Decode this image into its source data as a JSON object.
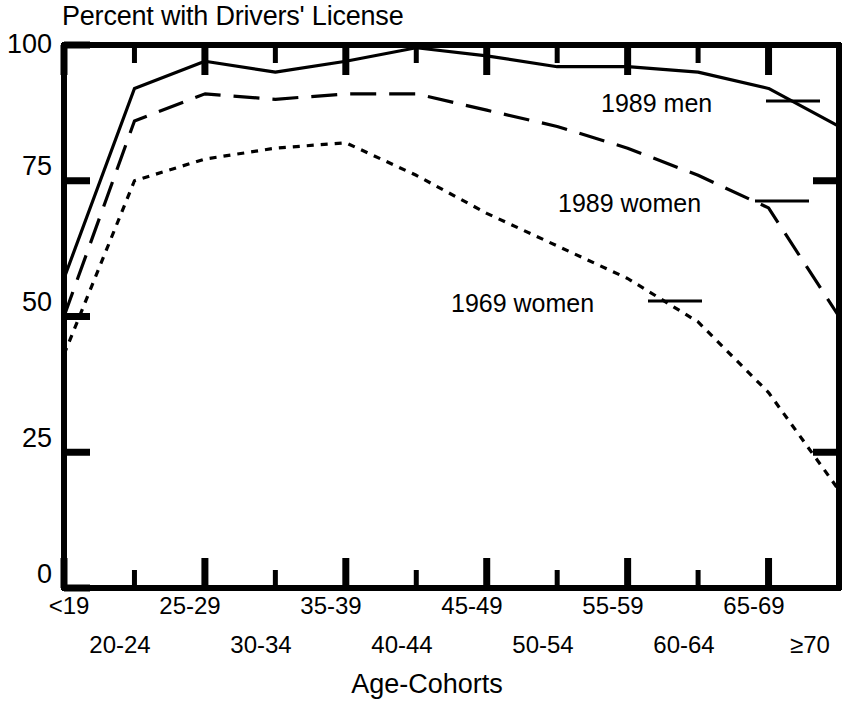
{
  "chart_data": {
    "type": "line",
    "title": "Percent with Drivers' License",
    "xlabel": "Age-Cohorts",
    "ylabel": "",
    "categories": [
      "<19",
      "20-24",
      "25-29",
      "30-34",
      "35-39",
      "40-44",
      "45-49",
      "50-54",
      "55-59",
      "60-64",
      "65-69",
      "≥70"
    ],
    "series": [
      {
        "name": "1989 men",
        "style": "solid",
        "values": [
          57,
          92,
          97,
          95,
          97,
          99.5,
          98,
          96,
          96,
          95,
          92,
          85
        ]
      },
      {
        "name": "1989 women",
        "style": "long-dash",
        "values": [
          50,
          86,
          91,
          90,
          91,
          91,
          88,
          85,
          81,
          76,
          70,
          50
        ]
      },
      {
        "name": "1969 women",
        "style": "short-dash",
        "values": [
          43,
          75,
          79,
          81,
          82,
          76,
          69,
          63,
          57,
          49,
          36,
          18
        ]
      }
    ],
    "ylim": [
      0,
      100
    ],
    "yticks": [
      0,
      25,
      50,
      75,
      100
    ],
    "ytick_labels": [
      "0",
      "25",
      "50",
      "75",
      "100"
    ],
    "grid": false,
    "legend_position": "inside-right",
    "axis_color": "#000000",
    "line_color": "#000000"
  },
  "axes": {
    "y_labels": [
      {
        "text": "100",
        "value": 100
      },
      {
        "text": "75",
        "value": 75
      },
      {
        "text": "50",
        "value": 50
      },
      {
        "text": "25",
        "value": 25
      },
      {
        "text": "0",
        "value": 0
      }
    ],
    "x_labels_top_row": [
      "<19",
      "25-29",
      "35-39",
      "45-49",
      "55-59",
      "65-69"
    ],
    "x_labels_bottom_row": [
      "20-24",
      "30-34",
      "40-44",
      "50-54",
      "60-64",
      "≥70"
    ]
  },
  "legend": {
    "entries": [
      {
        "label": "1989 men"
      },
      {
        "label": "1989 women"
      },
      {
        "label": "1969 women"
      }
    ]
  }
}
